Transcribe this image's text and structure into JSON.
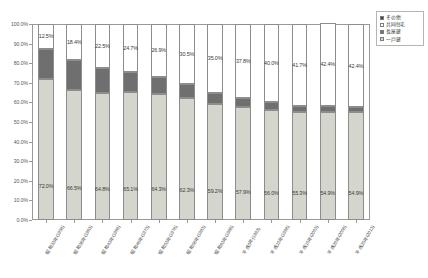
{
  "chart_data": {
    "type": "bar",
    "subtype": "stacked-100-percent",
    "title": "",
    "xlabel": "",
    "ylabel": "",
    "ylim": [
      0,
      100
    ],
    "ytick_labels": [
      "0.0%",
      "10.0%",
      "20.0%",
      "30.0%",
      "40.0%",
      "50.0%",
      "60.0%",
      "70.0%",
      "80.0%",
      "90.0%",
      "100.0%"
    ],
    "ytick_values": [
      0,
      10,
      20,
      30,
      40,
      50,
      60,
      70,
      80,
      90,
      100
    ],
    "grid": false,
    "legend_position": "top-right",
    "categories": [
      "昭和33年(1958)",
      "昭和38年(1963)",
      "昭和43年(1968)",
      "昭和48年(1973)",
      "昭和53年(1978)",
      "昭和58年(1983)",
      "昭和63年(1988)",
      "平成5年(1993)",
      "平成10年(1998)",
      "平成15年(2003)",
      "平成20年(2008)",
      "平成25年(2013)"
    ],
    "series": [
      {
        "name": "一戸建",
        "color": "#d4d6cd",
        "values": [
          72.0,
          66.5,
          64.8,
          65.1,
          64.3,
          62.3,
          59.2,
          57.9,
          56.0,
          55.3,
          54.9,
          54.9
        ],
        "labels": [
          "72.0%",
          "66.5%",
          "64.8%",
          "65.1%",
          "64.3%",
          "62.3%",
          "59.2%",
          "57.9%",
          "56.0%",
          "55.3%",
          "54.9%",
          "54.9%"
        ]
      },
      {
        "name": "長屋建",
        "color": "#6f6f6f",
        "values": [
          15.5,
          15.1,
          12.7,
          10.2,
          8.8,
          7.2,
          5.8,
          4.3,
          4.1,
          3.0,
          3.4,
          2.7
        ],
        "labels": [
          "",
          "",
          "",
          "",
          "",
          "",
          "",
          "",
          "",
          "",
          "",
          ""
        ]
      },
      {
        "name": "共同住宅",
        "color": "#ffffff",
        "values": [
          12.5,
          18.4,
          22.5,
          24.7,
          26.9,
          30.5,
          35.0,
          37.8,
          40.0,
          41.7,
          42.4,
          42.4
        ],
        "labels": [
          "12.5%",
          "18.4%",
          "22.5%",
          "24.7%",
          "26.9%",
          "30.5%",
          "35.0%",
          "37.8%",
          "40.0%",
          "41.7%",
          "42.4%",
          "42.4%"
        ]
      },
      {
        "name": "その他",
        "color": "#3f3f3f",
        "values": [
          0.0,
          0.0,
          0.0,
          0.0,
          0.0,
          0.0,
          0.0,
          0.0,
          0.0,
          0.0,
          0.0,
          0.0
        ],
        "labels": [
          "",
          "",
          "",
          "",
          "",
          "",
          "",
          "",
          "",
          "",
          "",
          ""
        ]
      }
    ],
    "legend_entries": [
      {
        "label": "その他",
        "color": "#3f3f3f"
      },
      {
        "label": "共同住宅",
        "color": "#ffffff"
      },
      {
        "label": "長屋建",
        "color": "#6f6f6f"
      },
      {
        "label": "一戸建",
        "color": "#d4d6cd"
      }
    ]
  },
  "colors": {
    "detached": "#d4d6cd",
    "row_house": "#6f6f6f",
    "apartment": "#ffffff",
    "other": "#3f3f3f",
    "axis": "#9a9a9a",
    "text": "#3a3a3a"
  }
}
